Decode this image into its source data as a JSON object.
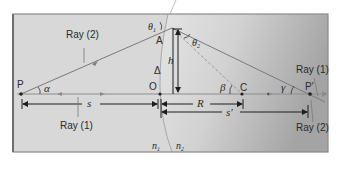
{
  "diagram": {
    "colors": {
      "background_left": "#d9d9d9",
      "background_right_light": "#e6e6e6",
      "background_right_dark": "#a9a9a9",
      "frame_border": "#8a8a8a",
      "ray_line": "#7a7a7a",
      "axis_line": "#8c8c8c",
      "dimension_line": "#1e1e1e",
      "dashed_line": "#8a8a8a",
      "text": "#2a2a2a"
    },
    "labels": {
      "ray2_top": "Ray (2)",
      "ray1_bottom_left": "Ray (1)",
      "ray1_right": "Ray (1)",
      "ray2_right": "Ray (2)",
      "point_P": "P",
      "point_A": "A",
      "point_O": "O",
      "point_C": "C",
      "point_Pprime": "P′",
      "delta": "Δ",
      "h": "h",
      "theta1": "θ",
      "theta1_sub": "1",
      "theta2": "θ",
      "theta2_sub": "2",
      "alpha": "α",
      "beta": "β",
      "gamma": "γ",
      "s": "s",
      "sprime": "s′",
      "R": "R",
      "n1": "n",
      "n1_sub": "1",
      "n2": "n",
      "n2_sub": "2"
    }
  }
}
